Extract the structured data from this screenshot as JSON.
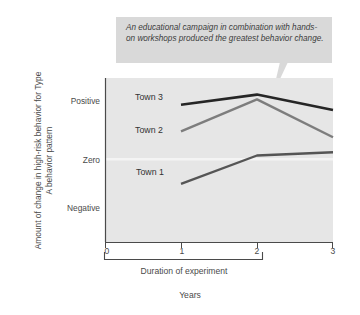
{
  "callout": {
    "text": "An educational campaign in combination with hands-on workshops produced the greatest behavior change."
  },
  "chart_data": {
    "type": "line",
    "title": "",
    "xlabel": "Duration of experiment",
    "xunit": "Years",
    "ylabel": "Amount of change in high-risk behavior for Type A behavior pattern",
    "x": [
      1,
      2,
      3
    ],
    "xticks": [
      "0",
      "1",
      "2",
      "3"
    ],
    "xlim": [
      0,
      3
    ],
    "yticks": [
      "Positive",
      "Zero",
      "Negative"
    ],
    "ytick_values": [
      1,
      0,
      -1
    ],
    "ylim": [
      -1.55,
      1.52
    ],
    "grid": false,
    "zero_line": true,
    "legend": "inline-labels",
    "bracket": {
      "from": "0",
      "to": "2"
    },
    "series": [
      {
        "name": "Town 1",
        "color": "#555555",
        "values": [
          -0.46,
          0.07,
          0.13
        ]
      },
      {
        "name": "Town 2",
        "color": "#7d7d7d",
        "values": [
          0.52,
          1.12,
          0.41
        ]
      },
      {
        "name": "Town 3",
        "color": "#262626",
        "values": [
          1.02,
          1.21,
          0.92
        ]
      }
    ]
  },
  "colors": {
    "plot_background": "#e6e6e6",
    "callout_background": "#d9d9d9",
    "axis": "#4a4a4a",
    "zero_line": "#f2f2f2"
  }
}
